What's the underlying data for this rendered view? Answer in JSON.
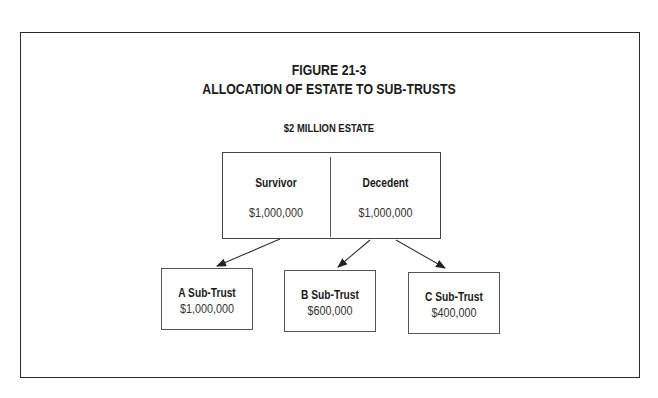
{
  "figure": {
    "number": "FIGURE 21-3",
    "title": "ALLOCATION OF ESTATE TO SUB-TRUSTS",
    "estate_label": "$2 MILLION ESTATE"
  },
  "estate": {
    "survivor": {
      "label": "Survivor",
      "amount": "$1,000,000"
    },
    "decedent": {
      "label": "Decedent",
      "amount": "$1,000,000"
    }
  },
  "sub_trusts": [
    {
      "label": "A Sub-Trust",
      "amount": "$1,000,000",
      "source": "survivor"
    },
    {
      "label": "B Sub-Trust",
      "amount": "$600,000",
      "source": "decedent"
    },
    {
      "label": "C Sub-Trust",
      "amount": "$400,000",
      "source": "decedent"
    }
  ],
  "colors": {
    "line": "#333333",
    "text": "#1a1a1a"
  }
}
